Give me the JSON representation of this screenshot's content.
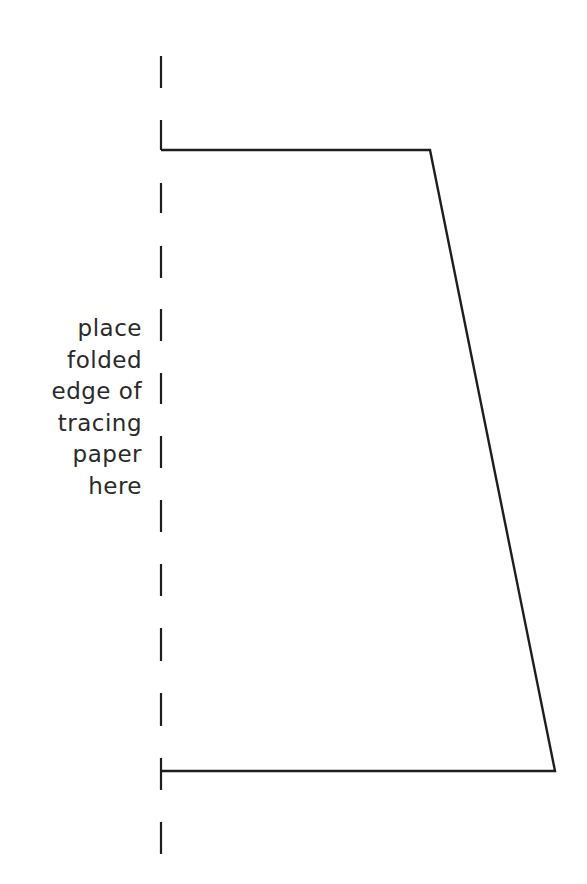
{
  "label": {
    "lines": [
      "place",
      "folded",
      "edge of",
      "tracing",
      "paper",
      "here"
    ]
  },
  "pattern": {
    "fold_line_x": 161,
    "fold_dashes": [
      [
        56,
        88
      ],
      [
        120,
        150
      ],
      [
        183,
        213
      ],
      [
        246,
        278
      ],
      [
        309,
        341
      ],
      [
        373,
        404
      ],
      [
        436,
        468
      ],
      [
        500,
        532
      ],
      [
        564,
        596
      ],
      [
        628,
        661
      ],
      [
        693,
        726
      ],
      [
        758,
        790
      ],
      [
        822,
        854
      ]
    ],
    "shape_points": [
      [
        161,
        150
      ],
      [
        430,
        150
      ],
      [
        555,
        771
      ],
      [
        161,
        771
      ]
    ],
    "stroke_color": "#1e1e1e"
  }
}
